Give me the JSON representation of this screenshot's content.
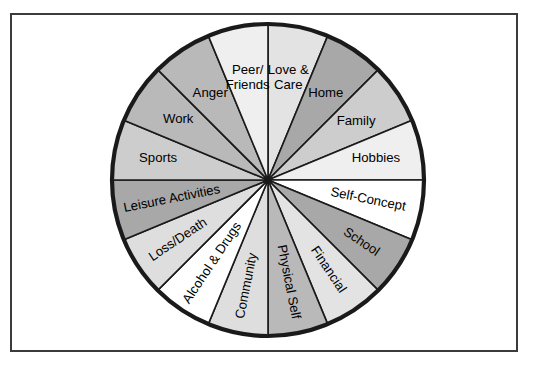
{
  "figure": {
    "title": "",
    "center_x": 268,
    "center_y": 180,
    "radius": 156,
    "outline_color": "#1a1a1a",
    "frame_color": "#3b3b3b",
    "background_color": "#ffffff"
  },
  "chart_data": {
    "type": "pie",
    "title": "",
    "xlabel": "",
    "ylabel": "",
    "legend": "none",
    "grid": false,
    "note": "Sixteen equal sectors of 22.5 degrees each; labels are placed radially within each wedge.",
    "categories": [
      "Love & Care",
      "Home",
      "Family",
      "Hobbies",
      "Self-Concept",
      "School",
      "Financial",
      "Physical Self",
      "Community",
      "Alcohol & Drugs",
      "Loss/Death",
      "Leisure Activities",
      "Sports",
      "Work",
      "Anger",
      "Peer/Friends"
    ],
    "values": [
      22.5,
      22.5,
      22.5,
      22.5,
      22.5,
      22.5,
      22.5,
      22.5,
      22.5,
      22.5,
      22.5,
      22.5,
      22.5,
      22.5,
      22.5,
      22.5
    ],
    "slice_colors": [
      "#e3e3e3",
      "#a8a8a8",
      "#cdcdcd",
      "#efefef",
      "#ffffff",
      "#a8a8a8",
      "#e3e3e3",
      "#b9b9b9",
      "#dedede",
      "#ffffff",
      "#dedede",
      "#a8a8a8",
      "#cdcdcd",
      "#b9b9b9",
      "#b9b9b9",
      "#efefef"
    ]
  },
  "wedges": [
    {
      "label": "Love & Care",
      "lines": [
        "Love &",
        "Care"
      ],
      "color": "#e3e3e3",
      "start_deg": -90,
      "end_deg": -67.5,
      "label_angle_deg": -78.75,
      "label_radius": 104,
      "text_rotate": 0,
      "multiline": true
    },
    {
      "label": "Home",
      "lines": [
        "Home"
      ],
      "color": "#a8a8a8",
      "start_deg": -67.5,
      "end_deg": -45,
      "label_angle_deg": -56.25,
      "label_radius": 104,
      "text_rotate": 0,
      "multiline": false
    },
    {
      "label": "Family",
      "lines": [
        "Family"
      ],
      "color": "#cdcdcd",
      "start_deg": -45,
      "end_deg": -22.5,
      "label_angle_deg": -33.75,
      "label_radius": 106,
      "text_rotate": 0,
      "multiline": false
    },
    {
      "label": "Hobbies",
      "lines": [
        "Hobbies"
      ],
      "color": "#efefef",
      "start_deg": -22.5,
      "end_deg": 0,
      "label_angle_deg": -11.25,
      "label_radius": 110,
      "text_rotate": 0,
      "multiline": false
    },
    {
      "label": "Self-Concept",
      "lines": [
        "Self-Concept"
      ],
      "color": "#ffffff",
      "start_deg": 0,
      "end_deg": 22.5,
      "label_angle_deg": 11.25,
      "label_radius": 102,
      "text_rotate": 11.25,
      "multiline": false
    },
    {
      "label": "School",
      "lines": [
        "School"
      ],
      "color": "#a8a8a8",
      "start_deg": 22.5,
      "end_deg": 45,
      "label_angle_deg": 33.75,
      "label_radius": 112,
      "text_rotate": 33.75,
      "multiline": false
    },
    {
      "label": "Financial",
      "lines": [
        "Financial"
      ],
      "color": "#e3e3e3",
      "start_deg": 45,
      "end_deg": 67.5,
      "label_angle_deg": 56.25,
      "label_radius": 108,
      "text_rotate": 56.25,
      "multiline": false
    },
    {
      "label": "Physical Self",
      "lines": [
        "Physical Self"
      ],
      "color": "#b9b9b9",
      "start_deg": 67.5,
      "end_deg": 90,
      "label_angle_deg": 78.75,
      "label_radius": 104,
      "text_rotate": 78.75,
      "multiline": false
    },
    {
      "label": "Community",
      "lines": [
        "Community"
      ],
      "color": "#dedede",
      "start_deg": 90,
      "end_deg": 112.5,
      "label_angle_deg": 101.25,
      "label_radius": 108,
      "text_rotate": -78.75,
      "multiline": false
    },
    {
      "label": "Alcohol & Drugs",
      "lines": [
        "Alcohol & Drugs"
      ],
      "color": "#ffffff",
      "start_deg": 112.5,
      "end_deg": 135,
      "label_angle_deg": 123.75,
      "label_radius": 100,
      "text_rotate": -56.25,
      "multiline": false
    },
    {
      "label": "Loss/Death",
      "lines": [
        "Loss/Death"
      ],
      "color": "#dedede",
      "start_deg": 135,
      "end_deg": 157.5,
      "label_angle_deg": 146.25,
      "label_radius": 108,
      "text_rotate": -33.75,
      "multiline": false
    },
    {
      "label": "Leisure Activities",
      "lines": [
        "Leisure Activities"
      ],
      "color": "#a8a8a8",
      "start_deg": 157.5,
      "end_deg": 180,
      "label_angle_deg": 168.75,
      "label_radius": 98,
      "text_rotate": -11.25,
      "multiline": false
    },
    {
      "label": "Sports",
      "lines": [
        "Sports"
      ],
      "color": "#cdcdcd",
      "start_deg": 180,
      "end_deg": 202.5,
      "label_angle_deg": 191.25,
      "label_radius": 112,
      "text_rotate": 0,
      "multiline": false
    },
    {
      "label": "Work",
      "lines": [
        "Work"
      ],
      "color": "#b9b9b9",
      "start_deg": 202.5,
      "end_deg": 225,
      "label_angle_deg": 213.75,
      "label_radius": 108,
      "text_rotate": 0,
      "multiline": false
    },
    {
      "label": "Anger",
      "lines": [
        "Anger"
      ],
      "color": "#b9b9b9",
      "start_deg": 225,
      "end_deg": 247.5,
      "label_angle_deg": 236.25,
      "label_radius": 104,
      "text_rotate": 0,
      "multiline": false
    },
    {
      "label": "Peer/Friends",
      "lines": [
        "Peer/",
        "Friends"
      ],
      "color": "#efefef",
      "start_deg": 247.5,
      "end_deg": 270,
      "label_angle_deg": 258.75,
      "label_radius": 104,
      "text_rotate": 0,
      "multiline": true
    }
  ]
}
